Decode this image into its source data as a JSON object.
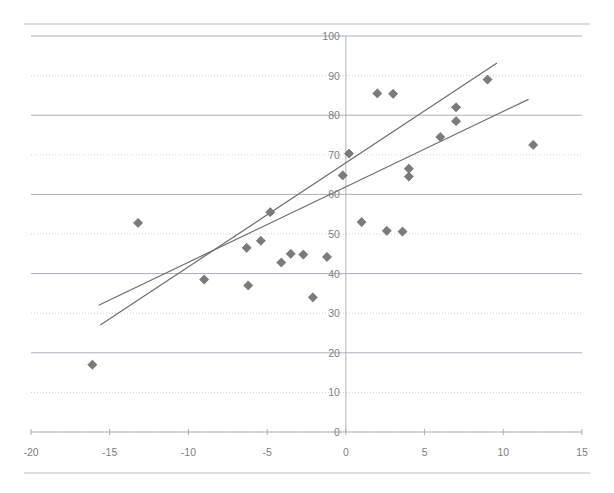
{
  "chart_data": {
    "type": "scatter",
    "title": "",
    "subtitle": "",
    "xlabel": "",
    "ylabel": "",
    "xlim": [
      -20,
      15
    ],
    "ylim": [
      0,
      100
    ],
    "xticks": [
      -20,
      -15,
      -10,
      -5,
      0,
      5,
      10,
      15
    ],
    "xtick_labels": [
      "-20",
      "-15",
      "-10",
      "-5",
      "0",
      "5",
      "10",
      "15"
    ],
    "yticks": [
      0,
      10,
      20,
      30,
      40,
      50,
      60,
      70,
      80,
      90,
      100
    ],
    "ytick_labels": [
      "0",
      "10",
      "20",
      "30",
      "40",
      "50",
      "60",
      "70",
      "80",
      "90",
      "100"
    ],
    "grid": true,
    "grid_axis": "y",
    "legend": false,
    "legend_position": "none",
    "marker_shape": "diamond",
    "marker_color": "#7a7a7a",
    "trendline_color": "#6e6e6e",
    "series": [
      {
        "name": "observations",
        "points": [
          [
            -16.1,
            17.0
          ],
          [
            -13.2,
            52.8
          ],
          [
            -9.0,
            38.5
          ],
          [
            -6.3,
            46.5
          ],
          [
            -6.2,
            37.0
          ],
          [
            -5.4,
            48.3
          ],
          [
            -4.8,
            55.5
          ],
          [
            -4.1,
            42.8
          ],
          [
            -3.5,
            45.0
          ],
          [
            -2.7,
            44.8
          ],
          [
            -2.1,
            34.0
          ],
          [
            -1.2,
            44.2
          ],
          [
            -0.2,
            64.8
          ],
          [
            0.2,
            70.3
          ],
          [
            1.0,
            53.0
          ],
          [
            2.0,
            85.5
          ],
          [
            3.0,
            85.4
          ],
          [
            2.6,
            50.8
          ],
          [
            3.6,
            50.6
          ],
          [
            4.0,
            66.5
          ],
          [
            4.0,
            64.5
          ],
          [
            6.0,
            74.5
          ],
          [
            7.0,
            82.0
          ],
          [
            7.0,
            78.5
          ],
          [
            9.0,
            89.0
          ],
          [
            11.9,
            72.5
          ]
        ]
      }
    ],
    "trendlines": [
      {
        "name": "steeper-fit",
        "x0": -15.6,
        "y0": 27.0,
        "x1": 9.6,
        "y1": 93.2
      },
      {
        "name": "shallower-fit",
        "x0": -15.7,
        "y0": 32.0,
        "x1": 11.6,
        "y1": 84.0
      }
    ]
  }
}
